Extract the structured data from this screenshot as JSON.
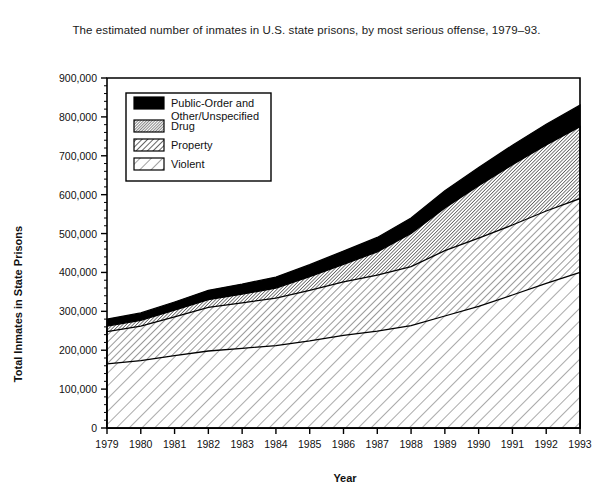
{
  "caption": "The estimated number of inmates in U.S. state prisons, by most serious offense, 1979–93.",
  "axes": {
    "xlabel": "Year",
    "ylabel": "Total Inmates in State Prisons",
    "ytick_labels": [
      "0",
      "100,000",
      "200,000",
      "300,000",
      "400,000",
      "500,000",
      "600,000",
      "700,000",
      "800,000",
      "900,000"
    ]
  },
  "legend": {
    "items": [
      {
        "label": "Public-Order and",
        "label2": "Other/Unspecified",
        "swatch": "solid-black"
      },
      {
        "label": "Drug",
        "label2": "",
        "swatch": "dense-hatch"
      },
      {
        "label": "Property",
        "label2": "",
        "swatch": "medium-hatch"
      },
      {
        "label": "Violent",
        "label2": "",
        "swatch": "sparse-hatch"
      }
    ]
  },
  "colors": {
    "public_order": "#000000",
    "drug": "#777777",
    "property": "#bbbbbb",
    "violent": "#eeeeee",
    "axis": "#000000"
  },
  "chart_data": {
    "type": "area",
    "title": "The estimated number of inmates in U.S. state prisons, by most serious offense, 1979–93.",
    "xlabel": "Year",
    "ylabel": "Total Inmates in State Prisons",
    "ylim": [
      0,
      900000
    ],
    "ytick_step": 100000,
    "yminor_step": 20000,
    "grid": false,
    "stacked": true,
    "legend_position": "upper-left-inside",
    "categories": [
      1979,
      1980,
      1981,
      1982,
      1983,
      1984,
      1985,
      1986,
      1987,
      1988,
      1989,
      1990,
      1991,
      1992,
      1993
    ],
    "series": [
      {
        "name": "Violent",
        "values": [
          165000,
          173000,
          186000,
          198000,
          205000,
          212000,
          224000,
          238000,
          249000,
          263000,
          288000,
          313000,
          342000,
          372000,
          400000
        ]
      },
      {
        "name": "Property",
        "values": [
          83000,
          89000,
          100000,
          112000,
          117000,
          122000,
          130000,
          138000,
          144000,
          152000,
          168000,
          175000,
          180000,
          186000,
          190000
        ]
      },
      {
        "name": "Drug",
        "values": [
          14000,
          15000,
          17000,
          20000,
          22000,
          26000,
          35000,
          45000,
          60000,
          85000,
          110000,
          135000,
          155000,
          170000,
          185000
        ]
      },
      {
        "name": "Public-Order and Other/Unspecified",
        "values": [
          18000,
          19000,
          21000,
          24000,
          26000,
          28000,
          31000,
          34000,
          37000,
          40000,
          44000,
          47000,
          50000,
          53000,
          55000
        ]
      }
    ],
    "totals": [
      280000,
      296000,
      324000,
      354000,
      370000,
      388000,
      420000,
      455000,
      490000,
      540000,
      610000,
      670000,
      727000,
      781000,
      830000
    ]
  }
}
